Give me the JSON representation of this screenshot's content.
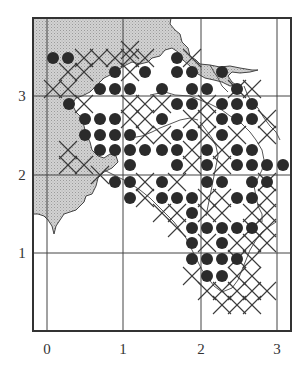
{
  "map": {
    "colors": {
      "land": "#c9c9c9",
      "sea": "#ffffff",
      "frame": "#333333",
      "grid": "#444444",
      "dot": "#2b2b2b",
      "cross": "#3a3a3a",
      "coast": "#444444"
    },
    "frame": {
      "x1": 33,
      "y1": 18,
      "x2": 291,
      "y2": 331
    },
    "x_axis": {
      "ticks": [
        {
          "label": "0",
          "px": 47
        },
        {
          "label": "1",
          "px": 123
        },
        {
          "label": "2",
          "px": 201
        },
        {
          "label": "3",
          "px": 277
        }
      ],
      "label_y": 354
    },
    "y_axis": {
      "ticks": [
        {
          "label": "3",
          "py": 96
        },
        {
          "label": "2",
          "py": 175
        },
        {
          "label": "1",
          "py": 253
        }
      ],
      "label_x": 22
    },
    "legend": {
      "dot_meaning": "filled circle",
      "cross_meaning": "cross"
    },
    "dots": [
      [
        53,
        58
      ],
      [
        68,
        58
      ],
      [
        177,
        58
      ],
      [
        115,
        72
      ],
      [
        145,
        72
      ],
      [
        177,
        72
      ],
      [
        192,
        72
      ],
      [
        222,
        72
      ],
      [
        100,
        89
      ],
      [
        115,
        89
      ],
      [
        130,
        89
      ],
      [
        162,
        89
      ],
      [
        192,
        89
      ],
      [
        207,
        89
      ],
      [
        237,
        89
      ],
      [
        69,
        104
      ],
      [
        177,
        104
      ],
      [
        192,
        104
      ],
      [
        222,
        104
      ],
      [
        237,
        104
      ],
      [
        252,
        104
      ],
      [
        85,
        119
      ],
      [
        100,
        119
      ],
      [
        115,
        119
      ],
      [
        162,
        119
      ],
      [
        222,
        119
      ],
      [
        237,
        119
      ],
      [
        252,
        119
      ],
      [
        85,
        135
      ],
      [
        100,
        135
      ],
      [
        115,
        135
      ],
      [
        130,
        135
      ],
      [
        177,
        135
      ],
      [
        192,
        135
      ],
      [
        222,
        135
      ],
      [
        100,
        150
      ],
      [
        115,
        150
      ],
      [
        130,
        150
      ],
      [
        145,
        150
      ],
      [
        162,
        150
      ],
      [
        177,
        150
      ],
      [
        207,
        150
      ],
      [
        237,
        150
      ],
      [
        252,
        150
      ],
      [
        130,
        165
      ],
      [
        177,
        165
      ],
      [
        207,
        165
      ],
      [
        237,
        165
      ],
      [
        252,
        165
      ],
      [
        267,
        165
      ],
      [
        283,
        165
      ],
      [
        115,
        182
      ],
      [
        130,
        182
      ],
      [
        162,
        182
      ],
      [
        207,
        182
      ],
      [
        222,
        182
      ],
      [
        252,
        182
      ],
      [
        267,
        182
      ],
      [
        130,
        198
      ],
      [
        162,
        198
      ],
      [
        177,
        198
      ],
      [
        192,
        198
      ],
      [
        237,
        198
      ],
      [
        252,
        198
      ],
      [
        192,
        213
      ],
      [
        192,
        228
      ],
      [
        207,
        228
      ],
      [
        222,
        228
      ],
      [
        237,
        228
      ],
      [
        252,
        228
      ],
      [
        192,
        243
      ],
      [
        222,
        243
      ],
      [
        192,
        259
      ],
      [
        207,
        259
      ],
      [
        222,
        259
      ],
      [
        237,
        259
      ],
      [
        207,
        276
      ],
      [
        222,
        276
      ]
    ],
    "crosses": [
      [
        84,
        58
      ],
      [
        99,
        58
      ],
      [
        115,
        58
      ],
      [
        130,
        58
      ],
      [
        130,
        50
      ],
      [
        68,
        72
      ],
      [
        84,
        72
      ],
      [
        130,
        72
      ],
      [
        145,
        58
      ],
      [
        192,
        58
      ],
      [
        53,
        89
      ],
      [
        68,
        89
      ],
      [
        237,
        89
      ],
      [
        252,
        89
      ],
      [
        84,
        104
      ],
      [
        130,
        104
      ],
      [
        145,
        104
      ],
      [
        162,
        104
      ],
      [
        207,
        104
      ],
      [
        130,
        119
      ],
      [
        145,
        119
      ],
      [
        192,
        119
      ],
      [
        207,
        119
      ],
      [
        145,
        135
      ],
      [
        162,
        135
      ],
      [
        207,
        135
      ],
      [
        237,
        135
      ],
      [
        267,
        135
      ],
      [
        267,
        119
      ],
      [
        68,
        150
      ],
      [
        68,
        165
      ],
      [
        84,
        165
      ],
      [
        192,
        150
      ],
      [
        192,
        165
      ],
      [
        222,
        150
      ],
      [
        100,
        175
      ],
      [
        222,
        165
      ],
      [
        267,
        198
      ],
      [
        145,
        182
      ],
      [
        177,
        182
      ],
      [
        145,
        198
      ],
      [
        207,
        198
      ],
      [
        222,
        198
      ],
      [
        267,
        182
      ],
      [
        162,
        213
      ],
      [
        177,
        213
      ],
      [
        207,
        213
      ],
      [
        222,
        213
      ],
      [
        252,
        213
      ],
      [
        267,
        213
      ],
      [
        177,
        228
      ],
      [
        267,
        228
      ],
      [
        207,
        243
      ],
      [
        237,
        243
      ],
      [
        252,
        243
      ],
      [
        267,
        243
      ],
      [
        252,
        228
      ],
      [
        237,
        259
      ],
      [
        252,
        259
      ],
      [
        192,
        276
      ],
      [
        237,
        276
      ],
      [
        252,
        276
      ],
      [
        207,
        291
      ],
      [
        222,
        291
      ],
      [
        237,
        291
      ],
      [
        252,
        291
      ],
      [
        267,
        291
      ],
      [
        222,
        305
      ],
      [
        237,
        305
      ],
      [
        252,
        305
      ]
    ],
    "land_path": "M33,18 L171,18 L170,24 L175,30 L180,34 L182,42 L188,48 L190,56 L196,60 L200,64 L210,65 L220,67 L230,66 L240,68 L252,70 L258,70 L250,72 L240,73 L232,72 L228,76 L232,82 L236,85 L230,86 L222,82 L214,80 L205,78 L198,74 L190,66 L183,60 L178,52 L172,48 L165,50 L160,56 L152,58 L148,62 L140,64 L132,62 L124,66 L118,70 L112,74 L104,78 L96,86 L90,92 L82,96 L76,98 L72,104 L76,112 L82,118 L84,126 L86,134 L90,142 L92,150 L98,156 L104,158 L110,154 L116,156 L118,162 L112,168 L104,172 L98,178 L96,186 L92,194 L86,196 L84,202 L80,206 L76,210 L70,212 L64,214 L60,220 L56,226 L54,234 L52,226 L48,220 L44,216 L38,214 L33,214 Z",
    "coast_lines": [
      "M150,95 L165,92 L175,95 L190,96 L200,100 L210,104 L222,110 L230,116 L238,120 L244,126 L250,132 L256,140 L262,150 L264,160 L262,170 L258,178 L254,186 L256,196 L258,206 L262,214 L262,222",
      "M130,138 L142,136 L152,132 L160,128 L170,124 L180,120 L190,118 L198,120",
      "M200,122 L206,130 L212,138 L216,146 L218,156 L216,166 L214,176 L212,186 L210,196 L208,206 L206,216",
      "M104,170 L116,176 L128,182 L140,190 L150,198 L158,206 L166,214 L174,222 L180,230 L186,238 L190,246 L194,254 L198,262 L202,270 L208,278 L214,286 L222,292 L232,288 L238,280 L242,270 L246,260 L250,250 L256,240 L262,232 L270,226 L276,222",
      "M210,65 L214,72 L218,78 L222,86 L228,92",
      "M244,86 L248,96 L252,102 L258,108 L264,118 L270,126 L276,132 L280,140"
    ]
  }
}
